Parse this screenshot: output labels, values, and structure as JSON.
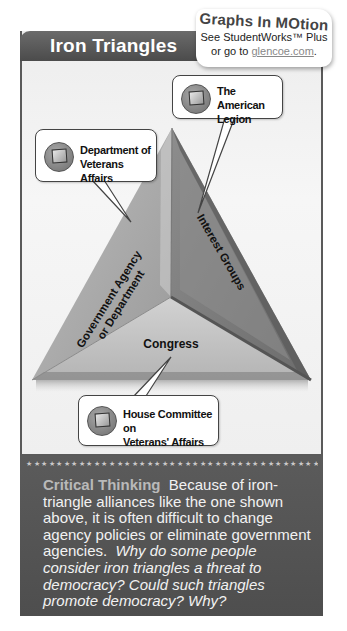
{
  "header": {
    "title": "Iron Triangles"
  },
  "graphs_in_motion": {
    "title": "Graphs In MOtion",
    "line1": "See StudentWorks™ Plus",
    "line2_prefix": "or go to ",
    "link": "glencoe.com",
    "line2_suffix": "."
  },
  "diagram": {
    "sides": [
      {
        "id": "left",
        "label_line1": "Government Agency",
        "label_line2": "or Department"
      },
      {
        "id": "right",
        "label": "Interest Groups"
      },
      {
        "id": "bottom",
        "label": "Congress"
      }
    ],
    "callouts": [
      {
        "id": "interest-group",
        "line1": "The American",
        "line2": "Legion",
        "icon": "computer-monitor-icon"
      },
      {
        "id": "agency",
        "line1": "Department of",
        "line2": "Veterans Affairs",
        "icon": "computer-monitor-icon"
      },
      {
        "id": "congress",
        "line1": "House Committee on",
        "line2": "Veterans' Affairs",
        "icon": "computer-monitor-icon"
      }
    ],
    "colors": {
      "left_face": "#a9a9a9",
      "right_face": "#7d7d7d",
      "bottom_face": "#c4c4c4",
      "edge_dark": "#555555"
    }
  },
  "critical_thinking": {
    "stars": "★★★★★★★★★★★★★★★★★★★★★★★★★★★★★★★★★★★★★★★★★★★★★★★",
    "heading": "Critical Thinking",
    "body": "Because of iron-triangle alliances like the one shown above, it is often difficult to change agency policies or eliminate government agencies.",
    "question": "Why do some people consider iron triangles a threat to democracy? Could such triangles promote democracy? Why?"
  }
}
